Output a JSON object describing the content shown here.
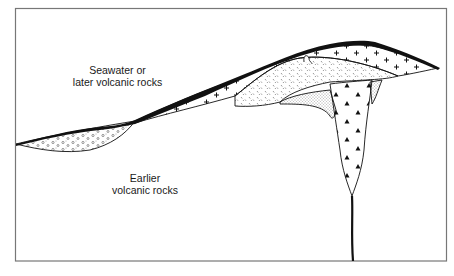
{
  "diagram": {
    "type": "geologic-cross-section",
    "labels": {
      "upper": {
        "line1": "Seawater or",
        "line2": "later volcanic rocks"
      },
      "lower": {
        "line1": "Earlier",
        "line2": "volcanic rocks"
      }
    },
    "units": [
      {
        "id": "black-crust",
        "pattern": "solid-black",
        "description": "thin black capping layer"
      },
      {
        "id": "plus-layer",
        "pattern": "plus-signs"
      },
      {
        "id": "dash-stipple-layer",
        "pattern": "short-dashes"
      },
      {
        "id": "fine-stipple-zone",
        "pattern": "fine-dots"
      },
      {
        "id": "circle-lens",
        "pattern": "small-circles"
      },
      {
        "id": "feeder-pipe",
        "pattern": "black-triangles"
      },
      {
        "id": "feeder-dike",
        "pattern": "single-black-line"
      }
    ],
    "colors": {
      "line": "#111111",
      "frame": "#777777",
      "background": "#ffffff"
    }
  }
}
